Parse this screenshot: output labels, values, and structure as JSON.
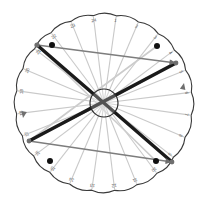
{
  "figure": {
    "background": "#ffffff",
    "width": 209,
    "height": 206
  },
  "dial": {
    "center": {
      "x": 104,
      "y": 103
    },
    "radius": 92,
    "rim_color": "#3a3a3a",
    "scallop_count": 24,
    "scallop_depth": 4,
    "hub": {
      "name": "center-hub",
      "radius": 14,
      "stroke": "#2b2b2b",
      "fill": "#ffffff"
    },
    "tick_labels": [
      "1",
      "2",
      "3",
      "4",
      "5",
      "6",
      "7",
      "8",
      "9",
      "10",
      "11",
      "12",
      "13",
      "14",
      "15",
      "16",
      "17",
      "18",
      "19",
      "20",
      "21",
      "22",
      "23",
      "24"
    ],
    "tick_label_color": "#5a5a5a",
    "tick_start_angle_deg": -82,
    "tick_step_deg": 15
  },
  "spokes": {
    "name": "radial-spokes",
    "color": "#c9c9c9",
    "width": 1.1,
    "angles_deg": [
      -82,
      -67,
      -52,
      -37,
      -22,
      -7,
      8,
      23,
      38,
      53,
      68,
      83,
      98,
      113,
      128,
      143,
      158,
      173,
      188,
      203,
      218,
      233,
      248,
      263
    ]
  },
  "nodes": [
    {
      "name": "node-upper-left",
      "x": 37,
      "y": 45,
      "color": "#6f6f6f",
      "r": 2.6
    },
    {
      "name": "node-right",
      "x": 176,
      "y": 63,
      "color": "#6f6f6f",
      "r": 2.4
    },
    {
      "name": "node-lower-left",
      "x": 29,
      "y": 141,
      "color": "#6f6f6f",
      "r": 2.4
    },
    {
      "name": "node-lower-right",
      "x": 172,
      "y": 162,
      "color": "#6f6f6f",
      "r": 2.4
    }
  ],
  "dots": [
    {
      "name": "marker-dot-top-left",
      "x": 52,
      "y": 45,
      "r": 3.0,
      "color": "#111111"
    },
    {
      "name": "marker-dot-top-right",
      "x": 157,
      "y": 46,
      "r": 3.0,
      "color": "#111111"
    },
    {
      "name": "marker-dot-bottom-left",
      "x": 50,
      "y": 161,
      "r": 3.0,
      "color": "#111111"
    },
    {
      "name": "marker-dot-bottom-right",
      "x": 156,
      "y": 161,
      "r": 3.0,
      "color": "#111111"
    }
  ],
  "chords": [
    {
      "name": "chord-thick-ul-to-lr",
      "x1": 37,
      "y1": 45,
      "x2": 172,
      "y2": 162,
      "color": "#1a1a1a",
      "width": 3.4,
      "arrow": false
    },
    {
      "name": "chord-thick-ll-to-ur",
      "x1": 29,
      "y1": 141,
      "x2": 176,
      "y2": 63,
      "color": "#1a1a1a",
      "width": 3.4,
      "arrow": false
    },
    {
      "name": "chord-gray-top",
      "x1": 37,
      "y1": 45,
      "x2": 176,
      "y2": 63,
      "color": "#7d7d7d",
      "width": 1.3,
      "arrow": true
    },
    {
      "name": "chord-gray-bottom",
      "x1": 29,
      "y1": 141,
      "x2": 172,
      "y2": 162,
      "color": "#7d7d7d",
      "width": 1.3,
      "arrow": true
    },
    {
      "name": "chord-gray-hub-to-ll",
      "x1": 104,
      "y1": 103,
      "x2": 29,
      "y2": 141,
      "color": "#9a9a9a",
      "width": 1.2,
      "arrow": false
    },
    {
      "name": "chord-gray-hub-to-ur",
      "x1": 104,
      "y1": 103,
      "x2": 176,
      "y2": 63,
      "color": "#b0b0b0",
      "width": 1.2,
      "arrow": false
    },
    {
      "name": "chord-light-ul-to-lr",
      "x1": 37,
      "y1": 45,
      "x2": 156,
      "y2": 161,
      "color": "#cccccc",
      "width": 1.6,
      "arrow": false
    },
    {
      "name": "chord-light-ll-to-ur",
      "x1": 29,
      "y1": 141,
      "x2": 157,
      "y2": 46,
      "color": "#cccccc",
      "width": 1.6,
      "arrow": false
    }
  ],
  "arrowheads": [
    {
      "name": "arrowhead-right-rim",
      "x": 176,
      "y": 63,
      "angle_deg": 7,
      "color": "#6f6f6f"
    },
    {
      "name": "arrowhead-right-mid",
      "x": 184,
      "y": 83,
      "angle_deg": -78,
      "color": "#6f6f6f"
    },
    {
      "name": "arrowhead-left-mid",
      "x": 23,
      "y": 118,
      "angle_deg": 100,
      "color": "#6f6f6f"
    },
    {
      "name": "arrowhead-bottom-rim",
      "x": 172,
      "y": 162,
      "angle_deg": 9,
      "color": "#6f6f6f"
    }
  ]
}
